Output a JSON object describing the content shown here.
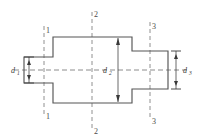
{
  "figure": {
    "type": "engineering-drawing",
    "background_color": "#ffffff",
    "outline_color": "#555555",
    "centerline_color": "#6f6f6f",
    "sectionline_color": "#757575",
    "dimension_color": "#3a3a3a"
  },
  "dimensions": [
    {
      "id": "d1",
      "base": "d",
      "subscript": "1",
      "label": "d₁",
      "position": "left",
      "describes": "left shaft diameter"
    },
    {
      "id": "d2",
      "base": "d",
      "subscript": "2",
      "label": "d₂",
      "position": "center",
      "describes": "center hub diameter"
    },
    {
      "id": "d3",
      "base": "d",
      "subscript": "3",
      "label": "d₃",
      "position": "right",
      "describes": "right shaft diameter"
    }
  ],
  "section_lines": [
    {
      "id": "section-1",
      "label": "1",
      "top_label": "1",
      "bottom_label": "1",
      "position": "left"
    },
    {
      "id": "section-2",
      "label": "2",
      "top_label": "2",
      "bottom_label": "2",
      "position": "center"
    },
    {
      "id": "section-3",
      "label": "3",
      "top_label": "3",
      "bottom_label": "3",
      "position": "right"
    }
  ],
  "geometry": {
    "profile_note": "symmetric stepped shaft about horizontal axis",
    "steps": [
      {
        "name": "left-shaft",
        "x_from": 24,
        "x_to": 53,
        "half_height": 13
      },
      {
        "name": "center-hub",
        "x_from": 53,
        "x_to": 132,
        "half_height": 33
      },
      {
        "name": "right-shaft",
        "x_from": 132,
        "x_to": 168,
        "half_height": 19
      }
    ],
    "axis_y": 70
  }
}
